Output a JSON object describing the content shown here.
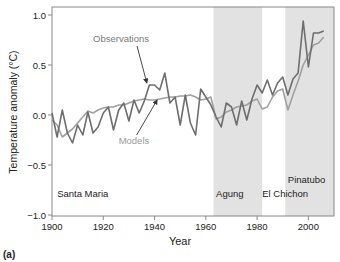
{
  "chart_data": {
    "type": "line",
    "title": "",
    "panel_label": "(a)",
    "xlabel": "Year",
    "ylabel": "Temperature anomaly (°C)",
    "xlim": [
      1900,
      2010
    ],
    "ylim": [
      -1.0,
      1.0
    ],
    "xticks": [
      1900,
      1920,
      1940,
      1960,
      1980,
      2000
    ],
    "xtick_labels": [
      "1900",
      "1920",
      "1940",
      "1960",
      "1980",
      "2000"
    ],
    "yticks": [
      -1.0,
      -0.5,
      0.0,
      0.5,
      1.0
    ],
    "ytick_labels": [
      "−1.0",
      "−0.5",
      "0.0",
      "0.5",
      "1.0"
    ],
    "grid": false,
    "shaded_regions": [
      {
        "x0": 1963,
        "x1": 1982,
        "color": "#e2e2e2"
      },
      {
        "x0": 1991,
        "x1": 2010,
        "color": "#e2e2e2"
      }
    ],
    "event_labels": [
      {
        "text": "Santa Maria",
        "x": 1902,
        "y": -0.82
      },
      {
        "text": "Agung",
        "x": 1964,
        "y": -0.82
      },
      {
        "text": "El Chichon",
        "x": 1982,
        "y": -0.82
      },
      {
        "text": "Pinatubo",
        "x": 1992,
        "y": -0.68
      }
    ],
    "annotations": [
      {
        "text": "Observations",
        "text_x": 1916,
        "text_y": 0.73,
        "arrow_to_x": 1937,
        "arrow_to_y": 0.32,
        "color": "#7a7a7a"
      },
      {
        "text": "Models",
        "text_x": 1926,
        "text_y": -0.29,
        "arrow_to_x": 1941,
        "arrow_to_y": 0.15,
        "color": "#9a9a9a"
      }
    ],
    "x": [
      1900,
      1902,
      1904,
      1906,
      1908,
      1910,
      1912,
      1914,
      1916,
      1918,
      1920,
      1922,
      1924,
      1926,
      1928,
      1930,
      1932,
      1934,
      1936,
      1938,
      1940,
      1942,
      1944,
      1946,
      1948,
      1950,
      1952,
      1954,
      1956,
      1958,
      1960,
      1962,
      1964,
      1966,
      1968,
      1970,
      1972,
      1974,
      1976,
      1978,
      1980,
      1982,
      1984,
      1986,
      1988,
      1990,
      1992,
      1994,
      1996,
      1998,
      2000,
      2002,
      2004,
      2006
    ],
    "series": [
      {
        "name": "Observations",
        "color": "#6e6e6e",
        "values": [
          0.02,
          -0.22,
          0.05,
          -0.18,
          -0.28,
          -0.1,
          -0.2,
          0.03,
          -0.18,
          -0.12,
          0.02,
          0.08,
          -0.15,
          0.05,
          0.12,
          -0.06,
          0.15,
          0.02,
          0.14,
          0.3,
          0.3,
          0.25,
          0.42,
          0.12,
          0.18,
          -0.1,
          0.2,
          -0.08,
          -0.2,
          0.26,
          0.18,
          0.1,
          -0.02,
          -0.12,
          0.12,
          0.08,
          -0.1,
          0.14,
          -0.05,
          0.16,
          0.3,
          0.22,
          0.35,
          0.2,
          0.32,
          0.38,
          0.2,
          0.36,
          0.42,
          0.94,
          0.48,
          0.82,
          0.82,
          0.84
        ]
      },
      {
        "name": "Models",
        "color": "#a0a0a0",
        "values": [
          -0.05,
          -0.1,
          -0.22,
          -0.18,
          -0.14,
          -0.08,
          -0.02,
          0.04,
          0.02,
          0.05,
          0.07,
          0.08,
          0.08,
          0.1,
          0.1,
          0.12,
          0.14,
          0.15,
          0.16,
          0.15,
          0.15,
          0.16,
          0.17,
          0.18,
          0.18,
          0.19,
          0.19,
          0.2,
          0.18,
          0.15,
          0.16,
          0.18,
          -0.04,
          -0.02,
          0.03,
          0.05,
          0.08,
          0.09,
          0.1,
          0.14,
          0.16,
          0.06,
          0.08,
          0.18,
          0.24,
          0.26,
          0.05,
          0.2,
          0.34,
          0.5,
          0.6,
          0.7,
          0.72,
          0.78
        ]
      }
    ]
  }
}
